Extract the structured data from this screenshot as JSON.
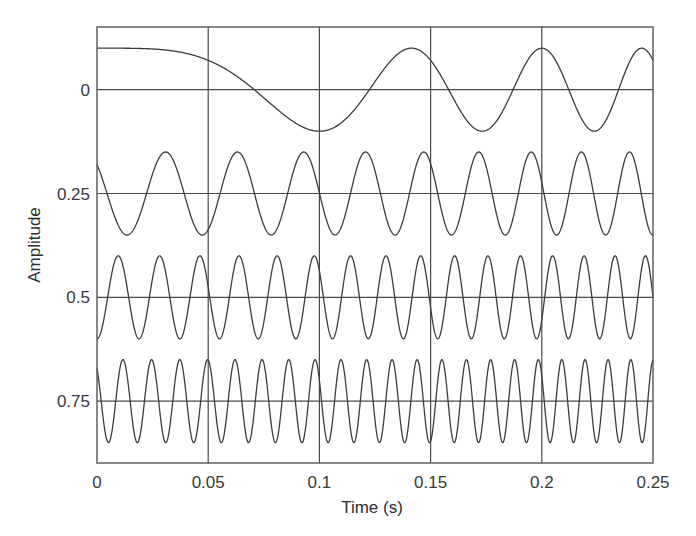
{
  "chart_data": {
    "type": "line",
    "title": "",
    "xlabel": "Time (s)",
    "ylabel": "Amplitude",
    "xlim": [
      0,
      0.25
    ],
    "ylim": [
      -0.151,
      0.899
    ],
    "y_inverted": true,
    "grid": true,
    "legend": null,
    "x_ticks": [
      0,
      0.05,
      0.1,
      0.15,
      0.2,
      0.25
    ],
    "x_tick_labels": [
      "0",
      "0.05",
      "0.1",
      "0.15",
      "0.2",
      "0.25"
    ],
    "y_ticks": [
      0,
      0.25,
      0.5,
      0.75
    ],
    "y_tick_labels": [
      "0",
      "0.25",
      "0.5",
      "0.75"
    ],
    "series": [
      {
        "name": "trace-1",
        "description": "chirp around 0 offset, slow start, amplitude 0.1",
        "offset": 0,
        "amplitude": 0.1,
        "phase0": 0,
        "f0_hz": 0,
        "chirp_rate": 50,
        "key_points": [
          [
            0,
            -0.1
          ],
          [
            0.05,
            -0.07
          ],
          [
            0.0707,
            0
          ],
          [
            0.1,
            0.1
          ],
          [
            0.1414,
            -0.1
          ],
          [
            0.1732,
            0.1
          ],
          [
            0.2,
            -0.1
          ],
          [
            0.2236,
            0.1
          ],
          [
            0.245,
            -0.1
          ],
          [
            0.25,
            -0.07
          ]
        ]
      },
      {
        "name": "trace-2",
        "description": "oscillation around 0.25, ~27 Hz rising to ~48 Hz",
        "offset": 0.25,
        "amplitude": 0.1,
        "phase0": 0.8,
        "f0_hz": 27,
        "chirp_rate": 42,
        "key_points": [
          [
            0,
            0.18
          ],
          [
            0.014,
            0.35
          ],
          [
            0.031,
            0.15
          ],
          [
            0.05,
            0.35
          ],
          [
            0.065,
            0.15
          ],
          [
            0.083,
            0.35
          ],
          [
            0.097,
            0.15
          ],
          [
            0.111,
            0.35
          ],
          [
            0.25,
            0.34
          ]
        ]
      },
      {
        "name": "trace-3",
        "description": "oscillation around 0.5, ~52 Hz rising to ~74 Hz",
        "offset": 0.5,
        "amplitude": 0.1,
        "phase0": 3.1416,
        "f0_hz": 52,
        "chirp_rate": 44,
        "key_points": [
          [
            0,
            0.6
          ],
          [
            0.0099,
            0.4
          ],
          [
            0.0288,
            0.4
          ],
          [
            0.047,
            0.4
          ],
          [
            0.065,
            0.4
          ],
          [
            0.1,
            0.4
          ],
          [
            0.2,
            0.6
          ],
          [
            0.248,
            0.4
          ]
        ]
      },
      {
        "name": "trace-4",
        "description": "oscillation around 0.75, ~76 Hz rising to ~99 Hz",
        "offset": 0.75,
        "amplitude": 0.1,
        "phase0": 0.67,
        "f0_hz": 76,
        "chirp_rate": 46,
        "key_points": [
          [
            0,
            0.672
          ],
          [
            0.0117,
            0.65
          ],
          [
            0.0499,
            0.65
          ],
          [
            0.098,
            0.65
          ],
          [
            0.15,
            0.85
          ],
          [
            0.198,
            0.65
          ],
          [
            0.24,
            0.65
          ],
          [
            0.25,
            0.68
          ]
        ]
      }
    ],
    "colors": {
      "line": "#3c3c3c",
      "grid": "#4a4a4a",
      "frame": "#555555",
      "background": "#ffffff"
    }
  }
}
